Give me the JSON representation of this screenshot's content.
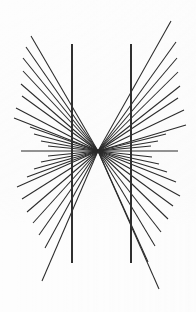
{
  "figure": {
    "name": "hering-illusion",
    "width": 196,
    "height": 312,
    "background_color": "#fdfdfd",
    "line_color": "#2a2a2a",
    "vertical_line_color": "#303030"
  },
  "chart_data": {
    "type": "scatter",
    "xlabel": "",
    "ylabel": "",
    "xlim": [
      0,
      196
    ],
    "ylim": [
      0,
      312
    ],
    "grid": false,
    "legend": "none",
    "annotations": [
      "Radial fan of straight lines converging at a single vanishing point",
      "Two straight parallel vertical lines appear bowed outward"
    ],
    "convergence_point": {
      "x": 98,
      "y": 151
    },
    "radial_lines": {
      "count": 42,
      "stroke_width": 1.05,
      "color": "#2a2a2a",
      "segments": [
        {
          "x1": 31,
          "y1": 36,
          "x2": 98,
          "y2": 151
        },
        {
          "x1": 26,
          "y1": 47,
          "x2": 98,
          "y2": 151
        },
        {
          "x1": 23,
          "y1": 58,
          "x2": 98,
          "y2": 151
        },
        {
          "x1": 23,
          "y1": 71,
          "x2": 98,
          "y2": 151
        },
        {
          "x1": 21,
          "y1": 84,
          "x2": 98,
          "y2": 151
        },
        {
          "x1": 22,
          "y1": 96,
          "x2": 98,
          "y2": 151
        },
        {
          "x1": 16,
          "y1": 108,
          "x2": 98,
          "y2": 151
        },
        {
          "x1": 14,
          "y1": 118,
          "x2": 98,
          "y2": 151
        },
        {
          "x1": 30,
          "y1": 127,
          "x2": 98,
          "y2": 151
        },
        {
          "x1": 34,
          "y1": 134,
          "x2": 98,
          "y2": 151
        },
        {
          "x1": 41,
          "y1": 141,
          "x2": 98,
          "y2": 151
        },
        {
          "x1": 48,
          "y1": 146,
          "x2": 98,
          "y2": 151
        },
        {
          "x1": 21,
          "y1": 151,
          "x2": 98,
          "y2": 151
        },
        {
          "x1": 48,
          "y1": 156,
          "x2": 98,
          "y2": 151
        },
        {
          "x1": 41,
          "y1": 162,
          "x2": 98,
          "y2": 151
        },
        {
          "x1": 34,
          "y1": 169,
          "x2": 98,
          "y2": 151
        },
        {
          "x1": 27,
          "y1": 177,
          "x2": 98,
          "y2": 151
        },
        {
          "x1": 17,
          "y1": 187,
          "x2": 98,
          "y2": 151
        },
        {
          "x1": 22,
          "y1": 199,
          "x2": 98,
          "y2": 151
        },
        {
          "x1": 27,
          "y1": 212,
          "x2": 98,
          "y2": 151
        },
        {
          "x1": 33,
          "y1": 223,
          "x2": 98,
          "y2": 151
        },
        {
          "x1": 39,
          "y1": 235,
          "x2": 98,
          "y2": 151
        },
        {
          "x1": 45,
          "y1": 248,
          "x2": 98,
          "y2": 151
        },
        {
          "x1": 42,
          "y1": 281,
          "x2": 98,
          "y2": 151
        },
        {
          "x1": 171,
          "y1": 21,
          "x2": 98,
          "y2": 151
        },
        {
          "x1": 176,
          "y1": 42,
          "x2": 98,
          "y2": 151
        },
        {
          "x1": 177,
          "y1": 58,
          "x2": 98,
          "y2": 151
        },
        {
          "x1": 178,
          "y1": 72,
          "x2": 98,
          "y2": 151
        },
        {
          "x1": 180,
          "y1": 86,
          "x2": 98,
          "y2": 151
        },
        {
          "x1": 178,
          "y1": 98,
          "x2": 98,
          "y2": 151
        },
        {
          "x1": 184,
          "y1": 110,
          "x2": 98,
          "y2": 151
        },
        {
          "x1": 186,
          "y1": 125,
          "x2": 98,
          "y2": 151
        },
        {
          "x1": 166,
          "y1": 134,
          "x2": 98,
          "y2": 151
        },
        {
          "x1": 158,
          "y1": 141,
          "x2": 98,
          "y2": 151
        },
        {
          "x1": 151,
          "y1": 146,
          "x2": 98,
          "y2": 151
        },
        {
          "x1": 178,
          "y1": 151,
          "x2": 98,
          "y2": 151
        },
        {
          "x1": 152,
          "y1": 157,
          "x2": 98,
          "y2": 151
        },
        {
          "x1": 159,
          "y1": 164,
          "x2": 98,
          "y2": 151
        },
        {
          "x1": 167,
          "y1": 172,
          "x2": 98,
          "y2": 151
        },
        {
          "x1": 176,
          "y1": 182,
          "x2": 98,
          "y2": 151
        },
        {
          "x1": 180,
          "y1": 196,
          "x2": 98,
          "y2": 151
        },
        {
          "x1": 173,
          "y1": 206,
          "x2": 98,
          "y2": 151
        },
        {
          "x1": 168,
          "y1": 219,
          "x2": 98,
          "y2": 151
        },
        {
          "x1": 161,
          "y1": 232,
          "x2": 98,
          "y2": 151
        },
        {
          "x1": 155,
          "y1": 246,
          "x2": 98,
          "y2": 151
        },
        {
          "x1": 148,
          "y1": 262,
          "x2": 98,
          "y2": 151
        },
        {
          "x1": 159,
          "y1": 289,
          "x2": 98,
          "y2": 151
        }
      ]
    },
    "vertical_lines": {
      "count": 2,
      "stroke_width": 1.5,
      "color": "#303030",
      "y_top": 44,
      "y_bottom": 263,
      "x_positions": [
        72,
        131
      ]
    }
  }
}
